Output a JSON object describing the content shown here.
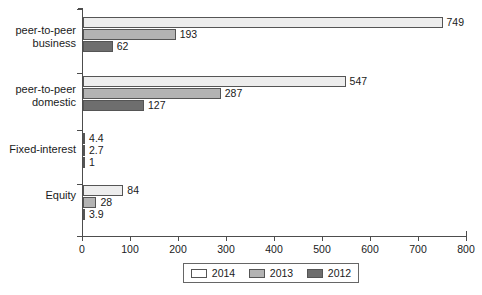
{
  "chart_data": {
    "type": "bar",
    "orientation": "horizontal",
    "title": "",
    "xlabel": "",
    "ylabel": "",
    "xlim": [
      0,
      800
    ],
    "xticks": [
      0,
      100,
      200,
      300,
      400,
      500,
      600,
      700,
      800
    ],
    "grid": false,
    "legend_position": "bottom",
    "categories": [
      "peer-to-peer\nbusiness",
      "peer-to-peer\ndomestic",
      "Fixed-interest",
      "Equity"
    ],
    "series": [
      {
        "name": "2014",
        "color": "#ededed",
        "values": [
          749,
          547,
          4.4,
          84
        ],
        "labels": [
          "749",
          "547",
          "4.4",
          "84"
        ]
      },
      {
        "name": "2013",
        "color": "#b3b3b3",
        "values": [
          193,
          287,
          2.7,
          28
        ],
        "labels": [
          "193",
          "287",
          "2.7",
          "28"
        ]
      },
      {
        "name": "2012",
        "color": "#6e6e6e",
        "values": [
          62,
          127,
          1,
          3.9
        ],
        "labels": [
          "62",
          "127",
          "1",
          "3.9"
        ]
      }
    ]
  },
  "axis": {
    "x_tick_labels": [
      "0",
      "100",
      "200",
      "300",
      "400",
      "500",
      "600",
      "700",
      "800"
    ],
    "category_labels": [
      "peer-to-peer\nbusiness",
      "peer-to-peer\ndomestic",
      "Fixed-interest",
      "Equity"
    ]
  },
  "legend": {
    "entries": [
      {
        "label": "2014",
        "color": "#ffffff"
      },
      {
        "label": "2013",
        "color": "#b3b3b3"
      },
      {
        "label": "2012",
        "color": "#6e6e6e"
      }
    ]
  }
}
